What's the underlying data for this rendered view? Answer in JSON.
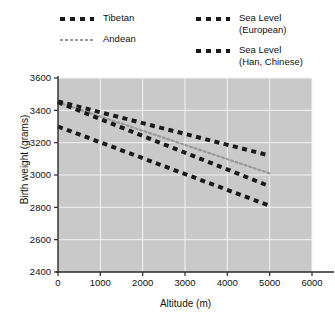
{
  "legend": {
    "entries": [
      {
        "label": "Tibetan",
        "style": "dash-black",
        "column": "left"
      },
      {
        "label": "Andean",
        "style": "dot-gray",
        "column": "left"
      },
      {
        "label": "Sea Level\n(European)",
        "line1": "Sea Level",
        "line2": "(European)",
        "style": "dash-black",
        "column": "right"
      },
      {
        "label": "Sea Level\n(Han, Chinese)",
        "line1": "Sea Level",
        "line2": "(Han, Chinese)",
        "style": "dash-black",
        "column": "right"
      }
    ]
  },
  "chart_data": {
    "type": "line",
    "title": "",
    "xlabel": "Altitude (m)",
    "ylabel": "Birth weight (grams)",
    "xlim": [
      0,
      6000
    ],
    "ylim": [
      2400,
      3600
    ],
    "xticks": [
      0,
      1000,
      2000,
      3000,
      4000,
      5000,
      6000
    ],
    "yticks": [
      2400,
      2600,
      2800,
      3000,
      3200,
      3400,
      3600
    ],
    "grid": true,
    "legend_position": "above-plot",
    "series": [
      {
        "name": "Tibetan",
        "color": "#1a1a1a",
        "style": "dash-black",
        "x": [
          0,
          5000
        ],
        "y": [
          3455,
          3120
        ]
      },
      {
        "name": "Andean",
        "color": "#9a9a9a",
        "style": "dot-gray",
        "x": [
          0,
          5000
        ],
        "y": [
          3450,
          3010
        ]
      },
      {
        "name": "Sea Level (European)",
        "color": "#1a1a1a",
        "style": "dash-black",
        "x": [
          0,
          5000
        ],
        "y": [
          3450,
          2930
        ]
      },
      {
        "name": "Sea Level (Han, Chinese)",
        "color": "#1a1a1a",
        "style": "dash-black",
        "x": [
          0,
          5000
        ],
        "y": [
          3300,
          2810
        ]
      }
    ],
    "plot_bg": "#c9c9c9",
    "grid_color": "#f2f2f2",
    "axis_color": "#2a2a2a"
  }
}
